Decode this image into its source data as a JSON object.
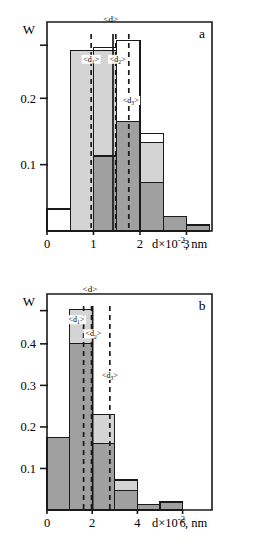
{
  "figure": {
    "background_color": "#ffffff",
    "line_color": "#1a1a1a",
    "light_fill": "#d4d4d4",
    "dark_fill": "#a0a0a0",
    "white_fill": "#ffffff"
  },
  "panels": [
    {
      "id": "a",
      "letter": "a",
      "y_axis_caption": "W",
      "x_axis_title_main": "d×10",
      "x_axis_title_sup": "-2",
      "x_axis_title_tail": ", nm",
      "y_ticks": [
        {
          "value": 0.1,
          "label": "0.1"
        },
        {
          "value": 0.2,
          "label": "0.2"
        },
        {
          "value": 0.28,
          "label": ""
        }
      ],
      "x_ticks": [
        {
          "value": 0,
          "label": "0"
        },
        {
          "value": 1,
          "label": "1"
        },
        {
          "value": 2,
          "label": "2"
        },
        {
          "value": 3,
          "label": "3"
        }
      ],
      "mean_lines": [
        {
          "name": "d1",
          "label_main": "<d",
          "label_sub": "1",
          "label_tail": ">",
          "x": 0.95,
          "label_x": 0.95,
          "label_y": 0.255,
          "style": "dashed"
        },
        {
          "name": "d2",
          "label_main": "<d",
          "label_sub": "2",
          "label_tail": ">",
          "x": 1.48,
          "label_x": 1.52,
          "label_y": 0.255,
          "style": "dashed"
        },
        {
          "name": "d3",
          "label_main": "<d",
          "label_sub": "3",
          "label_tail": ">",
          "x": 1.76,
          "label_x": 1.8,
          "label_y": 0.193,
          "style": "dashed"
        },
        {
          "name": "d",
          "label_main": "<d>",
          "label_sub": "",
          "label_tail": "",
          "x": 1.42,
          "label_x": 1.37,
          "label_y": 0.315,
          "style": "solid"
        }
      ]
    },
    {
      "id": "b",
      "letter": "b",
      "y_axis_caption": "W",
      "x_axis_title_main": "d×10",
      "x_axis_title_sup": "-2",
      "x_axis_title_tail": ", nm",
      "y_ticks": [
        {
          "value": 0.1,
          "label": "0.1"
        },
        {
          "value": 0.2,
          "label": "0.2"
        },
        {
          "value": 0.3,
          "label": "0.3"
        },
        {
          "value": 0.4,
          "label": "0.4"
        },
        {
          "value": 0.48,
          "label": ""
        }
      ],
      "x_ticks": [
        {
          "value": 0,
          "label": "0"
        },
        {
          "value": 2,
          "label": "2"
        },
        {
          "value": 4,
          "label": "4"
        },
        {
          "value": 6,
          "label": "6"
        }
      ],
      "mean_lines": [
        {
          "name": "d1",
          "label_main": "<d",
          "label_sub": "1",
          "label_tail": ">",
          "x": 1.62,
          "label_x": 1.3,
          "label_y": 0.452,
          "style": "dashed"
        },
        {
          "name": "d2",
          "label_main": "<d",
          "label_sub": "2",
          "label_tail": ">",
          "x": 1.97,
          "label_x": 2.05,
          "label_y": 0.418,
          "style": "dashed"
        },
        {
          "name": "d3",
          "label_main": "<d",
          "label_sub": "3",
          "label_tail": ">",
          "x": 2.78,
          "label_x": 2.78,
          "label_y": 0.318,
          "style": "dashed"
        },
        {
          "name": "d",
          "label_main": "<d>",
          "label_sub": "",
          "label_tail": "",
          "x": 2.02,
          "label_x": 1.9,
          "label_y": 0.525,
          "style": "solid"
        }
      ]
    }
  ],
  "chart_data": [
    {
      "type": "bar",
      "panel": "a",
      "title": "",
      "xlabel": "d×10-2, nm",
      "ylabel": "W",
      "xlim": [
        0,
        3.55
      ],
      "ylim": [
        0,
        0.315
      ],
      "grid": false,
      "bin_width": 0.5,
      "bin_edges": [
        0,
        0.5,
        1.0,
        1.5,
        2.0,
        2.5,
        3.0,
        3.5
      ],
      "series": [
        {
          "name": "white-outline",
          "fill": "#ffffff",
          "values": [
            0.033,
            0.145,
            0.277,
            0.287,
            0.147,
            0.019,
            0.0
          ]
        },
        {
          "name": "light-gray",
          "fill": "#d4d4d4",
          "values": [
            0.0,
            0.272,
            0.272,
            0.165,
            0.133,
            0.022,
            0.009
          ]
        },
        {
          "name": "dark-gray",
          "fill": "#a0a0a0",
          "values": [
            0.0,
            0.0,
            0.113,
            0.165,
            0.073,
            0.022,
            0.009
          ]
        }
      ]
    },
    {
      "type": "bar",
      "panel": "b",
      "title": "",
      "xlabel": "d×10-2, nm",
      "ylabel": "W",
      "xlim": [
        0,
        7.3
      ],
      "ylim": [
        0,
        0.52
      ],
      "grid": false,
      "bin_width": 1.0,
      "bin_edges": [
        0,
        1,
        2,
        3,
        4,
        5,
        6,
        7
      ],
      "series": [
        {
          "name": "light-gray",
          "fill": "#d4d4d4",
          "values": [
            0.175,
            0.483,
            0.23,
            0.072,
            0.013,
            0.019,
            0.0
          ]
        },
        {
          "name": "dark-gray",
          "fill": "#a0a0a0",
          "values": [
            0.175,
            0.4,
            0.16,
            0.047,
            0.013,
            0.019,
            0.0
          ]
        }
      ]
    }
  ]
}
